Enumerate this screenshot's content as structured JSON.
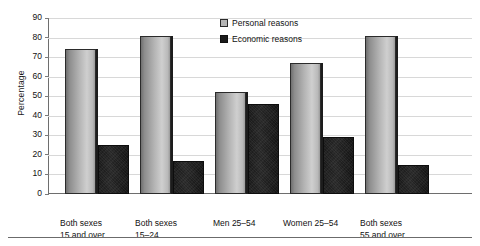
{
  "chart_data": {
    "type": "bar",
    "title": "",
    "xlabel": "",
    "ylabel": "Percentage",
    "ylim": [
      0,
      90
    ],
    "ytick_step": 10,
    "grid": true,
    "legend_position": "top-center",
    "categories": [
      "Both sexes 15 and over",
      "Both sexes 15–24",
      "Men  25–54",
      "Women  25–54",
      "Both sexes 55 and over"
    ],
    "category_lines": [
      [
        "Both sexes",
        "15 and over"
      ],
      [
        "Both sexes",
        "15–24"
      ],
      [
        "Men  25–54",
        ""
      ],
      [
        "Women  25–54",
        ""
      ],
      [
        "Both sexes",
        "55 and over"
      ]
    ],
    "series": [
      {
        "name": "Personal reasons",
        "color": "#b6b6b6",
        "values": [
          74,
          81,
          52,
          67,
          81
        ]
      },
      {
        "name": "Economic reasons",
        "color": "#1b1b1b",
        "values": [
          25,
          17,
          46,
          29,
          15
        ]
      }
    ],
    "yticks": [
      {
        "label": "90",
        "value": 90
      },
      {
        "label": "80",
        "value": 80
      },
      {
        "label": "70",
        "value": 70
      },
      {
        "label": "60",
        "value": 60
      },
      {
        "label": "50",
        "value": 50
      },
      {
        "label": "40",
        "value": 40
      },
      {
        "label": "30",
        "value": 30
      },
      {
        "label": "20",
        "value": 20
      },
      {
        "label": "10",
        "value": 10
      },
      {
        "label": "0",
        "value": 0
      }
    ]
  },
  "legend": {
    "items": [
      {
        "label": "Personal reasons",
        "swatch": "legend-swatch-personal"
      },
      {
        "label": "Economic reasons",
        "swatch": "legend-swatch-economic"
      }
    ]
  }
}
